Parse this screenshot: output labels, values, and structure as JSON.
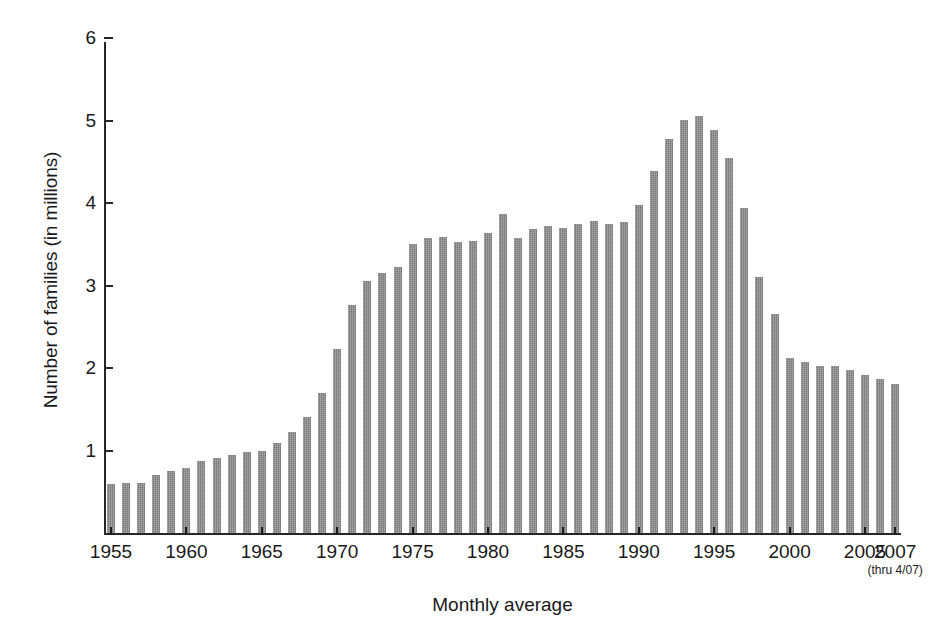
{
  "chart_data": {
    "type": "bar",
    "title": "",
    "xlabel": "Monthly average",
    "xlabel_sub": "(thru 4/07)",
    "ylabel": "Number of families (in millions)",
    "ylim": [
      0,
      6
    ],
    "y_ticks": [
      1,
      2,
      3,
      4,
      5,
      6
    ],
    "x_tick_labels": [
      "1955",
      "1960",
      "1965",
      "1970",
      "1975",
      "1980",
      "1985",
      "1990",
      "1995",
      "2000",
      "2005",
      "2007"
    ],
    "grid": false,
    "legend": false,
    "bar_color": "#878787",
    "axis_color": "#262626",
    "categories": [
      "1955",
      "1956",
      "1957",
      "1958",
      "1959",
      "1960",
      "1961",
      "1962",
      "1963",
      "1964",
      "1965",
      "1966",
      "1967",
      "1968",
      "1969",
      "1970",
      "1971",
      "1972",
      "1973",
      "1974",
      "1975",
      "1976",
      "1977",
      "1978",
      "1979",
      "1980",
      "1981",
      "1982",
      "1983",
      "1984",
      "1985",
      "1986",
      "1987",
      "1988",
      "1989",
      "1990",
      "1991",
      "1992",
      "1993",
      "1994",
      "1995",
      "1996",
      "1997",
      "1998",
      "1999",
      "2000",
      "2001",
      "2002",
      "2003",
      "2004",
      "2005",
      "2006",
      "2007"
    ],
    "values": [
      0.6,
      0.61,
      0.61,
      0.7,
      0.75,
      0.79,
      0.87,
      0.91,
      0.95,
      0.98,
      1.0,
      1.09,
      1.22,
      1.41,
      1.7,
      2.23,
      2.76,
      3.05,
      3.15,
      3.22,
      3.5,
      3.58,
      3.59,
      3.53,
      3.54,
      3.64,
      3.87,
      3.57,
      3.69,
      3.72,
      3.7,
      3.75,
      3.78,
      3.75,
      3.77,
      3.97,
      4.39,
      4.77,
      5.01,
      5.05,
      4.88,
      4.55,
      3.94,
      3.1,
      2.65,
      2.12,
      2.07,
      2.03,
      2.03,
      1.97,
      1.92,
      1.87,
      1.81
    ],
    "peak": {
      "category": "1994",
      "value": 5.05
    },
    "first": {
      "category": "1955",
      "value": 0.6
    },
    "last": {
      "category": "2007",
      "value": 1.81
    }
  },
  "axes": {
    "y_title": "Number of families (in millions)",
    "x_title": "Monthly average",
    "x_sub_note": "(thru 4/07)"
  }
}
